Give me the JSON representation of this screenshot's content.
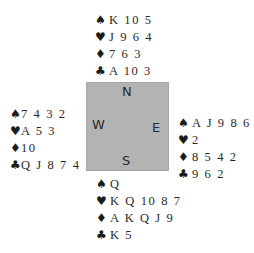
{
  "compass": {
    "north": "N",
    "south": "S",
    "east": "E",
    "west": "W"
  },
  "suit_symbols": {
    "spades": "♠",
    "hearts": "♥",
    "diamonds": "♦",
    "clubs": "♣"
  },
  "hands": {
    "north": {
      "spades": "K 10 5",
      "hearts": "J 9 6 4",
      "diamonds": "7 6 3",
      "clubs": "A 10 3"
    },
    "west": {
      "spades": "7 4 3 2",
      "hearts": "A 5 3",
      "diamonds": "10",
      "clubs": "Q J 8 7 4"
    },
    "east": {
      "spades": "A J 9 8 6",
      "hearts": "2",
      "diamonds": "8 5 4 2",
      "clubs": "9 6 2"
    },
    "south": {
      "spades": "Q",
      "hearts": "K Q 10 8 7",
      "diamonds": "A K Q J 9",
      "clubs": "K 5"
    }
  }
}
